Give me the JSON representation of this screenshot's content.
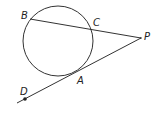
{
  "diagram": {
    "type": "geometry",
    "points": {
      "B": {
        "label": "B",
        "x": 30,
        "y": 19
      },
      "C": {
        "label": "C",
        "x": 92,
        "y": 29
      },
      "P": {
        "label": "P",
        "x": 141,
        "y": 38
      },
      "A": {
        "label": "A",
        "x": 78,
        "y": 73
      },
      "D": {
        "label": "D",
        "x": 25,
        "y": 99
      }
    },
    "circle": {
      "cx": 58,
      "cy": 41,
      "r": 35
    },
    "segments": [
      {
        "name": "secant-BP",
        "from": "B",
        "to": "P"
      },
      {
        "name": "tangent-PD",
        "from": "P",
        "to": "D"
      }
    ],
    "colors": {
      "stroke": "#333333",
      "label": "#222222"
    }
  }
}
